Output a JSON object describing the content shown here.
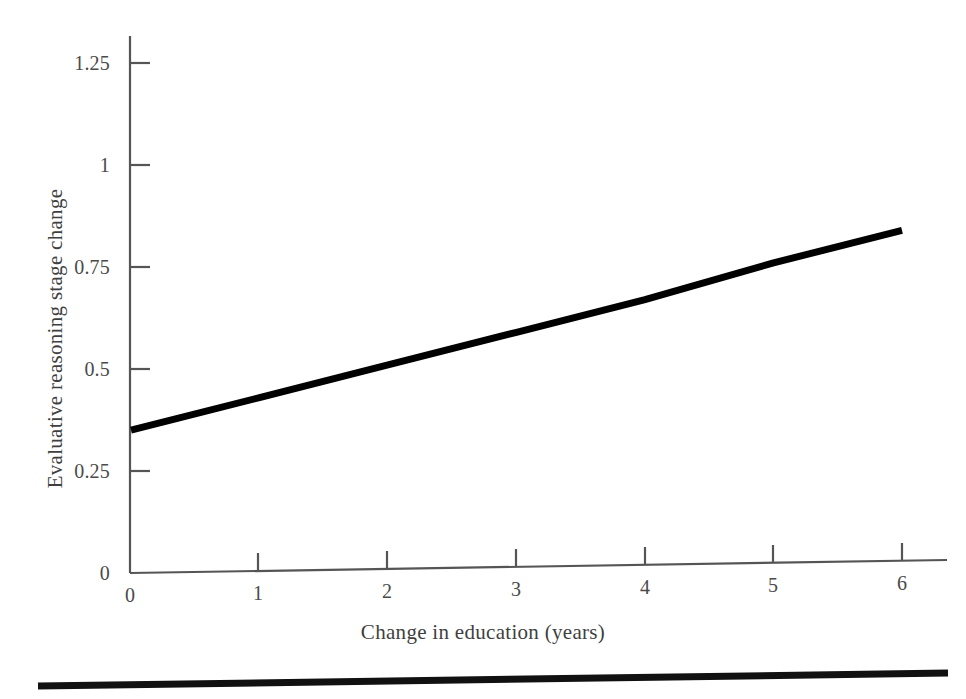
{
  "chart_data": {
    "type": "line",
    "title": "",
    "xlabel": "Change in education (years)",
    "ylabel": "Evaluative reasoning stage change",
    "xlim": [
      0,
      6
    ],
    "ylim": [
      0,
      1.25
    ],
    "grid": false,
    "legend": "none",
    "xticks": [
      "0",
      "1",
      "2",
      "3",
      "4",
      "5",
      "6"
    ],
    "xtick_values": [
      0,
      1,
      2,
      3,
      4,
      5,
      6
    ],
    "yticks": [
      "0",
      "0.25",
      "0.5",
      "0.75",
      "1",
      "1.25"
    ],
    "ytick_values": [
      0,
      0.25,
      0.5,
      0.75,
      1,
      1.25
    ],
    "series": [
      {
        "name": "Evaluative reasoning stage change",
        "color": "#000000",
        "x": [
          0,
          1,
          2,
          3,
          4,
          5,
          6
        ],
        "values": [
          0.35,
          0.43,
          0.51,
          0.59,
          0.67,
          0.76,
          0.84
        ]
      }
    ],
    "annotations": []
  },
  "axis": {
    "line_color": "#555555",
    "tick_color": "#555555"
  },
  "footer": {
    "rule_color": "#111111"
  }
}
